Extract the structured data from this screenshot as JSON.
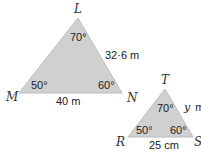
{
  "colors": {
    "fill": "#d0d0d0",
    "stroke": "#b8b8b8",
    "text": "#222222"
  },
  "triangles": [
    {
      "name": "LMN",
      "vertices": {
        "L": {
          "label": "L",
          "angle": "70°"
        },
        "M": {
          "label": "M",
          "angle": "50°"
        },
        "N": {
          "label": "N",
          "angle": "60°"
        }
      },
      "sides": {
        "LN": "32·6 m",
        "MN": "40 m"
      }
    },
    {
      "name": "TRS",
      "vertices": {
        "T": {
          "label": "T",
          "angle": "70°"
        },
        "R": {
          "label": "R",
          "angle": "50°"
        },
        "S": {
          "label": "S",
          "angle": "60°"
        }
      },
      "sides": {
        "TS_var": "y",
        "TS_unit": "m",
        "RS": "25 cm"
      }
    }
  ]
}
